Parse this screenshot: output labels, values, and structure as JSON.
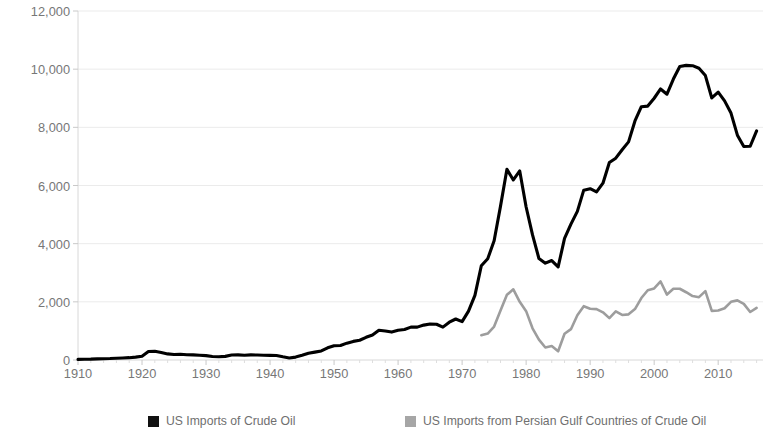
{
  "chart_data": {
    "type": "line",
    "title": "",
    "xlabel": "",
    "ylabel": "Thousand Barrels per Day (Mbbl/d)",
    "xlim": [
      1910,
      2017
    ],
    "ylim": [
      0,
      12000
    ],
    "grid": true,
    "legend_position": "bottom",
    "ytick_labels": [
      "12,000",
      "10,000",
      "8,000",
      "6,000",
      "4,000",
      "2,000",
      "0"
    ],
    "ytick_values": [
      12000,
      10000,
      8000,
      6000,
      4000,
      2000,
      0
    ],
    "xtick_labels": [
      "1910",
      "1920",
      "1930",
      "1940",
      "1950",
      "1960",
      "1970",
      "1980",
      "1990",
      "2000",
      "2010"
    ],
    "xtick_values": [
      1910,
      1920,
      1930,
      1940,
      1950,
      1960,
      1970,
      1980,
      1990,
      2000,
      2010
    ],
    "series": [
      {
        "name": "US Imports of Crude Oil",
        "color": "#000000",
        "x": [
          1910,
          1911,
          1912,
          1913,
          1914,
          1915,
          1916,
          1917,
          1918,
          1919,
          1920,
          1921,
          1922,
          1923,
          1924,
          1925,
          1926,
          1927,
          1928,
          1929,
          1930,
          1931,
          1932,
          1933,
          1934,
          1935,
          1936,
          1937,
          1938,
          1939,
          1940,
          1941,
          1942,
          1943,
          1944,
          1945,
          1946,
          1947,
          1948,
          1949,
          1950,
          1951,
          1952,
          1953,
          1954,
          1955,
          1956,
          1957,
          1958,
          1959,
          1960,
          1961,
          1962,
          1963,
          1964,
          1965,
          1966,
          1967,
          1968,
          1969,
          1970,
          1971,
          1972,
          1973,
          1974,
          1975,
          1976,
          1977,
          1978,
          1979,
          1980,
          1981,
          1982,
          1983,
          1984,
          1985,
          1986,
          1987,
          1988,
          1989,
          1990,
          1991,
          1992,
          1993,
          1994,
          1995,
          1996,
          1997,
          1998,
          1999,
          2000,
          2001,
          2002,
          2003,
          2004,
          2005,
          2006,
          2007,
          2008,
          2009,
          2010,
          2011,
          2012,
          2013,
          2014,
          2015,
          2016
        ],
        "y": [
          20,
          25,
          30,
          40,
          45,
          50,
          60,
          70,
          80,
          100,
          130,
          290,
          300,
          260,
          210,
          190,
          200,
          180,
          175,
          165,
          150,
          120,
          110,
          125,
          170,
          175,
          165,
          175,
          170,
          165,
          160,
          155,
          110,
          70,
          100,
          160,
          230,
          270,
          310,
          420,
          490,
          500,
          580,
          640,
          680,
          780,
          860,
          1020,
          1000,
          960,
          1020,
          1050,
          1130,
          1130,
          1200,
          1240,
          1230,
          1130,
          1300,
          1410,
          1320,
          1680,
          2220,
          3240,
          3480,
          4100,
          5290,
          6560,
          6190,
          6500,
          5260,
          4300,
          3490,
          3330,
          3420,
          3200,
          4180,
          4670,
          5110,
          5840,
          5890,
          5780,
          6080,
          6790,
          6940,
          7230,
          7500,
          8220,
          8710,
          8730,
          9000,
          9320,
          9140,
          9660,
          10090,
          10130,
          10120,
          10030,
          9780,
          9010,
          9210,
          8910,
          8490,
          7730,
          7340,
          7350,
          7880
        ]
      },
      {
        "name": "US Imports from Persian Gulf Countries of Crude Oil",
        "color": "#9d9d9d",
        "x": [
          1973,
          1974,
          1975,
          1976,
          1977,
          1978,
          1979,
          1980,
          1981,
          1982,
          1983,
          1984,
          1985,
          1986,
          1987,
          1988,
          1989,
          1990,
          1991,
          1992,
          1993,
          1994,
          1995,
          1996,
          1997,
          1998,
          1999,
          2000,
          2001,
          2002,
          2003,
          2004,
          2005,
          2006,
          2007,
          2008,
          2009,
          2010,
          2011,
          2012,
          2013,
          2014,
          2015,
          2016
        ],
        "y": [
          850,
          910,
          1150,
          1700,
          2240,
          2430,
          2000,
          1680,
          1090,
          700,
          430,
          480,
          300,
          900,
          1060,
          1540,
          1850,
          1760,
          1750,
          1640,
          1440,
          1670,
          1550,
          1570,
          1750,
          2130,
          2400,
          2460,
          2700,
          2250,
          2450,
          2450,
          2330,
          2200,
          2160,
          2370,
          1690,
          1700,
          1780,
          2000,
          2050,
          1930,
          1650,
          1790
        ]
      }
    ]
  },
  "legend": {
    "items": [
      {
        "label": "US Imports of Crude Oil",
        "color": "#111111"
      },
      {
        "label": "US Imports from Persian Gulf Countries of Crude Oil",
        "color": "#a6a6a6"
      }
    ]
  },
  "watermark": {
    "text": "TRADINGECONOMICS.COM"
  }
}
